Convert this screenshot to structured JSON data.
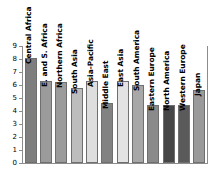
{
  "chart_data": {
    "type": "bar",
    "title": "",
    "subtitle": "",
    "xlabel": "",
    "ylabel": "",
    "ylim": [
      0,
      9
    ],
    "yticks": [
      "0",
      "1",
      "2",
      "3",
      "4",
      "5",
      "6",
      "7",
      "8",
      "9"
    ],
    "grid": false,
    "legend": "none",
    "orientation": "vertical",
    "label_rotation": "-90",
    "categories": [
      "Central Africa",
      "E. and S. Africa",
      "Northern Africa",
      "South Asia",
      "Asia-Pacific",
      "Middle East",
      "East Asia",
      "South America",
      "Eastern Europe",
      "North America",
      "Western Europe",
      "Japan"
    ],
    "values": [
      8.1,
      6.3,
      6.25,
      5.8,
      6.3,
      4.6,
      6.3,
      6.0,
      4.45,
      4.45,
      4.45,
      5.6
    ],
    "bar_colors": [
      "#7e7e7e",
      "#9b9b9b",
      "#9b9b9b",
      "#bdbdbd",
      "#dedede",
      "#828282",
      "#e3e3e3",
      "#a8a8a8",
      "#8a8a8a",
      "#464646",
      "#5a5a5a",
      "#9a9a9a"
    ],
    "bar_edge_color": "#6f6f6f",
    "axis_color": "#8c8c8c",
    "background": "#ffffff"
  }
}
